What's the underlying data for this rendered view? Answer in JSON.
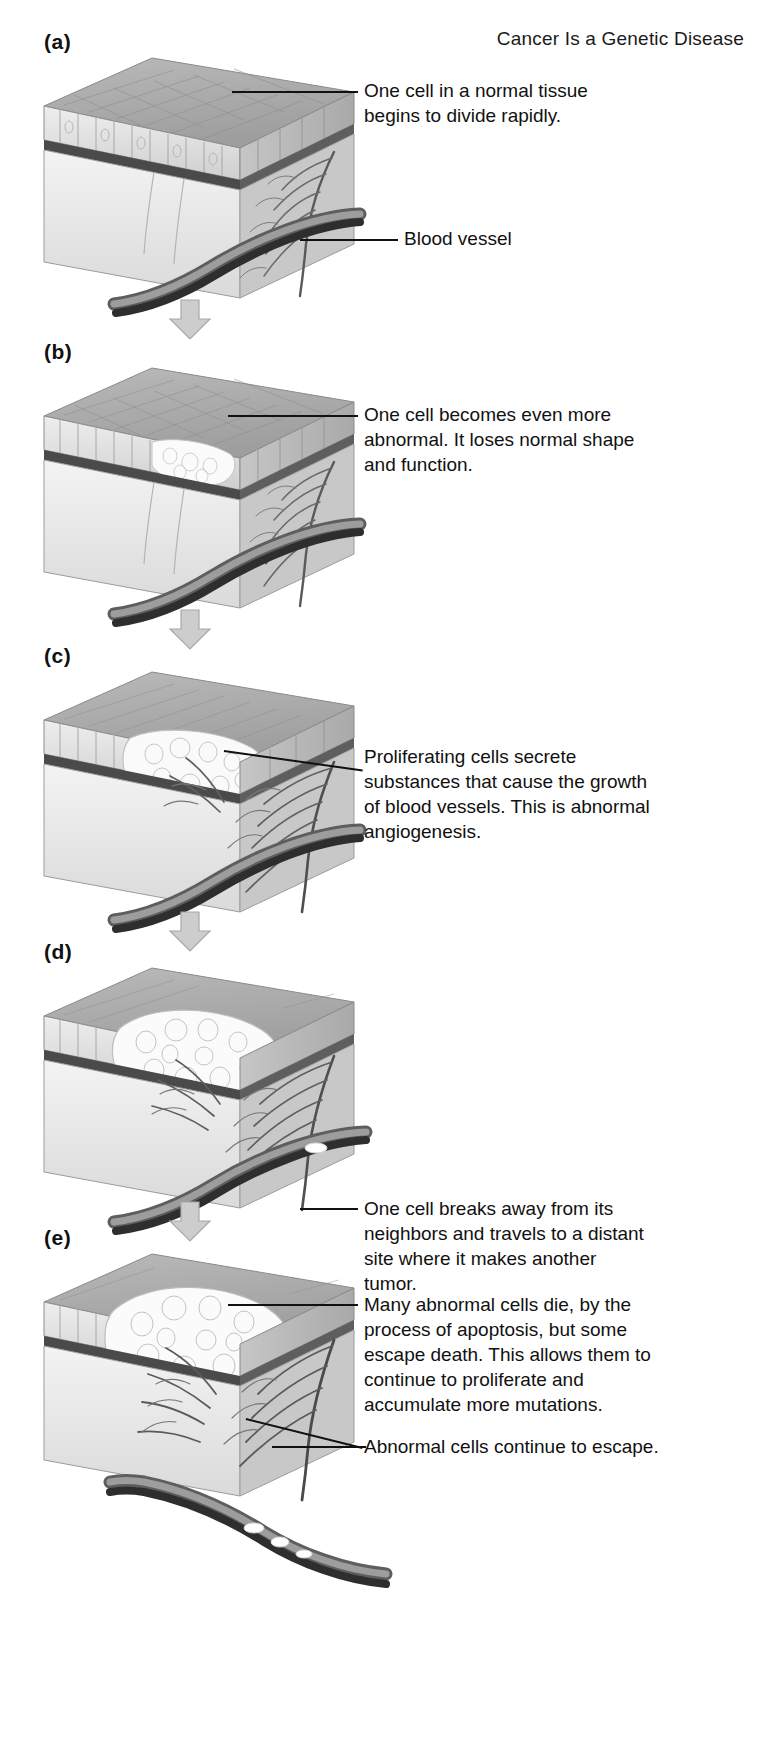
{
  "title": "Cancer Is a Genetic Disease",
  "panels": [
    {
      "label": "(a)",
      "notes": [
        "One cell in a normal tissue\nbegins to divide rapidly.",
        "Blood vessel"
      ]
    },
    {
      "label": "(b)",
      "notes": [
        "One cell becomes even more\nabnormal. It loses normal shape\nand function."
      ]
    },
    {
      "label": "(c)",
      "notes": [
        "Proliferating cells secrete\nsubstances that cause the growth\nof blood vessels. This is abnormal\nangiogenesis."
      ]
    },
    {
      "label": "(d)",
      "notes": [
        "One cell breaks away from its\nneighbors and travels to a distant\nsite where it makes another\ntumor."
      ]
    },
    {
      "label": "(e)",
      "notes": [
        "Many abnormal cells die, by the\nprocess of apoptosis, but some\nescape death. This allows them to\ncontinue to proliferate and\naccumulate more mutations.",
        "Abnormal cells continue to escape."
      ]
    }
  ],
  "icons": {
    "arrow": "down-arrow-icon",
    "tissue": "tissue-block-illustration",
    "vessel": "blood-vessel-illustration"
  },
  "colors": {
    "ink": "#111111",
    "arrow_fill": "#c9c9c9",
    "arrow_stroke": "#9a9a9a",
    "epithelium": "#dcdcdc",
    "stroma": "#cfcfcf",
    "tumor": "#f4f4f4",
    "vessel_dark": "#3f3f3f",
    "vessel_mid": "#8d8d8d"
  }
}
